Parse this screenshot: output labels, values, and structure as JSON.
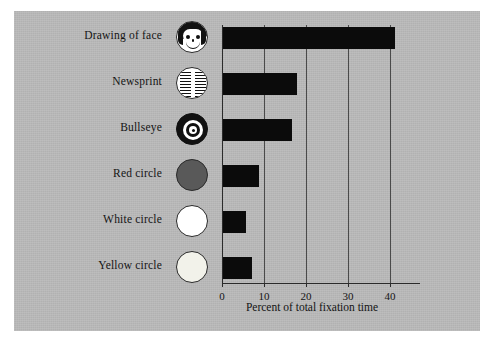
{
  "figure": {
    "background_color": "#b9b9b9",
    "bar_color": "#0b0b0b"
  },
  "chart_data": {
    "type": "bar",
    "orientation": "horizontal",
    "title": "",
    "xlabel": "Percent of total fixation time",
    "ylabel": "",
    "categories": [
      "Drawing of face",
      "Newsprint",
      "Bullseye",
      "Red circle",
      "White circle",
      "Yellow circle"
    ],
    "values": [
      41,
      17.5,
      16.5,
      8.5,
      5.5,
      7
    ],
    "xlim": [
      0,
      45
    ],
    "xticks": [
      0,
      10,
      20,
      30,
      40
    ],
    "xtick_labels": [
      "0",
      "10",
      "20",
      "30",
      "40"
    ],
    "grid": "vertical gridlines at each x tick",
    "legend": "none",
    "category_icons": [
      {
        "name": "face-icon",
        "label": "Drawing of face",
        "description": "cartoon smiling face with black hair"
      },
      {
        "name": "newsprint-icon",
        "label": "Newsprint",
        "description": "circle filled with two columns of text lines"
      },
      {
        "name": "bullseye-icon",
        "label": "Bullseye",
        "description": "concentric black and white rings with black center"
      },
      {
        "name": "red-circle-icon",
        "label": "Red circle",
        "color": "#595959"
      },
      {
        "name": "white-circle-icon",
        "label": "White circle",
        "color": "#ffffff"
      },
      {
        "name": "yellow-circle-icon",
        "label": "Yellow circle",
        "color": "#f2f2ea"
      }
    ]
  }
}
